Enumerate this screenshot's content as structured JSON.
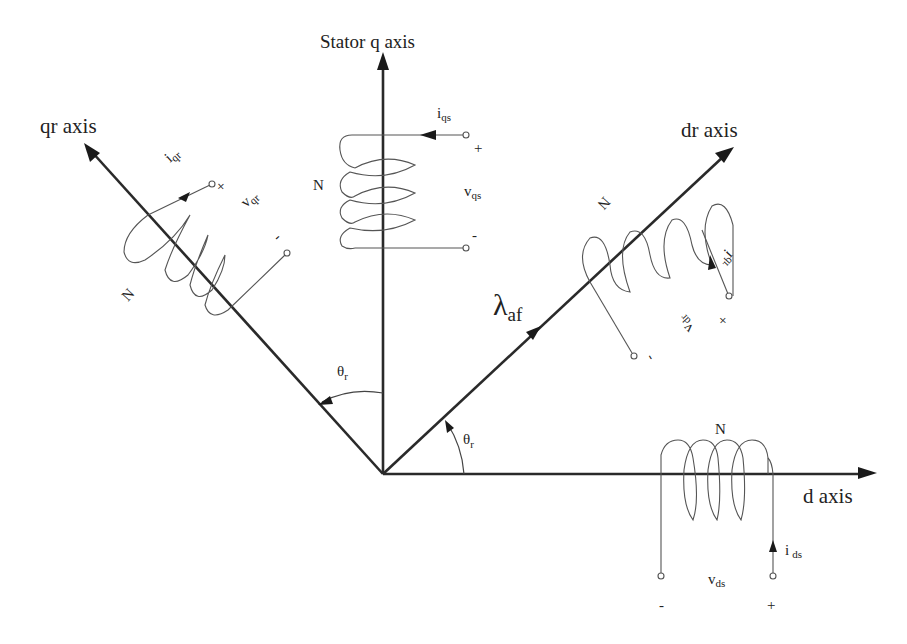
{
  "diagram": {
    "type": "machine reference frames (PMSM dq model)",
    "axes": {
      "stator_q": {
        "label": "Stator q axis"
      },
      "qr": {
        "label": "qr axis"
      },
      "dr": {
        "label": "dr axis"
      },
      "d": {
        "label": "d axis"
      }
    },
    "flux": {
      "symbol": "λ",
      "subscript": "af"
    },
    "angles": [
      {
        "symbol": "θ",
        "subscript": "r",
        "between": "Stator q axis → qr axis"
      },
      {
        "symbol": "θ",
        "subscript": "r",
        "between": "d axis → dr axis"
      }
    ],
    "windings": {
      "qs": {
        "turns": "N",
        "current": "i",
        "current_sub": "qs",
        "voltage": "v",
        "voltage_sub": "qs",
        "plus": "+",
        "minus": "-"
      },
      "qr": {
        "turns": "N",
        "current": "i",
        "current_sub": "qr",
        "voltage": "v",
        "voltage_sub": "qr",
        "plus": "+",
        "minus": "-"
      },
      "dr": {
        "turns": "N",
        "current": "i",
        "current_sub": "dr",
        "voltage": "v",
        "voltage_sub": "dr",
        "plus": "+",
        "minus": "-"
      },
      "ds": {
        "turns": "N",
        "current": "i",
        "current_sub": "ds",
        "voltage": "v",
        "voltage_sub": "ds",
        "plus": "+",
        "minus": "-"
      }
    },
    "colors": {
      "line": "#2a2a2a",
      "wire": "#555555",
      "background": "#ffffff"
    }
  }
}
